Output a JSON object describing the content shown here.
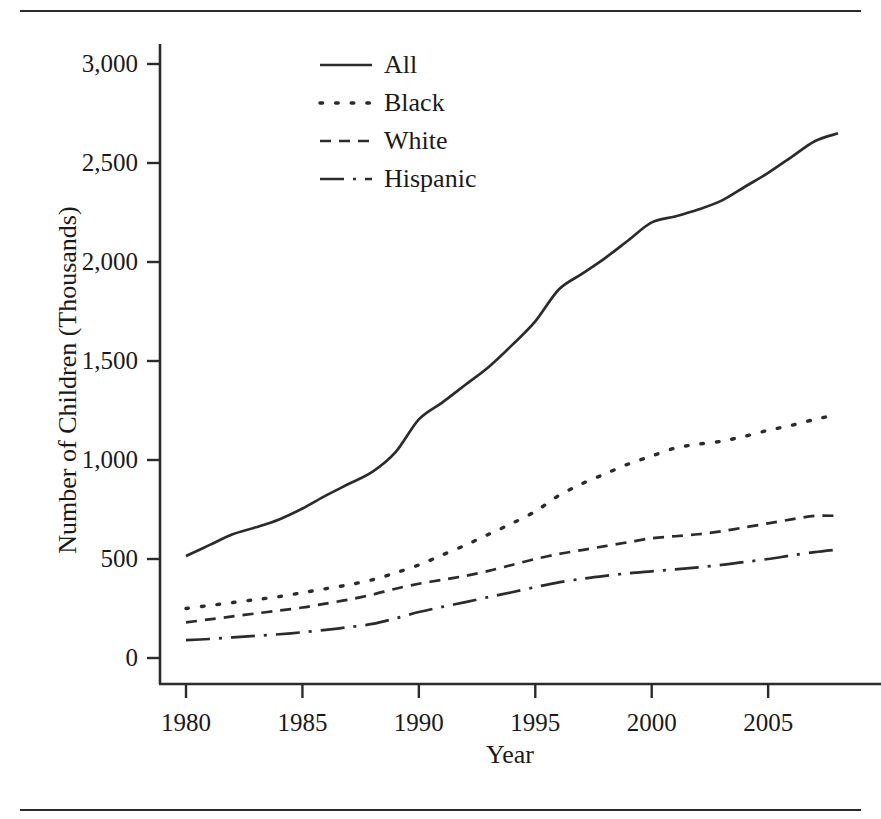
{
  "figure": {
    "has_top_rule": true,
    "has_bottom_rule": true,
    "rule_color": "#2b2b2b"
  },
  "chart_data": {
    "type": "line",
    "title": "",
    "xlabel": "Year",
    "ylabel": "Number of Children (Thousands)",
    "xlim": [
      1980,
      2008
    ],
    "ylim": [
      0,
      3100
    ],
    "xticks": [
      1980,
      1985,
      1990,
      1995,
      2000,
      2005
    ],
    "xtick_labels": [
      "1980",
      "1985",
      "1990",
      "1995",
      "2000",
      "2005"
    ],
    "yticks": [
      0,
      500,
      1000,
      1500,
      2000,
      2500,
      3000
    ],
    "ytick_labels": [
      "0",
      "500",
      "1,000",
      "1,500",
      "2,000",
      "2,500",
      "3,000"
    ],
    "grid": false,
    "legend_position": "upper-center-left",
    "x": [
      1980,
      1981,
      1982,
      1983,
      1984,
      1985,
      1986,
      1987,
      1988,
      1989,
      1990,
      1991,
      1992,
      1993,
      1994,
      1995,
      1996,
      1997,
      1998,
      1999,
      2000,
      2001,
      2002,
      2003,
      2004,
      2005,
      2006,
      2007,
      2008
    ],
    "series": [
      {
        "name": "All",
        "line_style": "solid",
        "color": "#2b2b2b",
        "values": [
          515,
          570,
          625,
          660,
          700,
          755,
          820,
          880,
          940,
          1040,
          1205,
          1290,
          1380,
          1470,
          1580,
          1700,
          1860,
          1940,
          2020,
          2110,
          2200,
          2230,
          2265,
          2310,
          2380,
          2450,
          2530,
          2610,
          2650
        ]
      },
      {
        "name": "Black",
        "line_style": "dotted",
        "color": "#2b2b2b",
        "values": [
          250,
          265,
          280,
          295,
          310,
          330,
          350,
          370,
          395,
          430,
          470,
          520,
          570,
          625,
          680,
          740,
          820,
          880,
          930,
          980,
          1020,
          1060,
          1080,
          1095,
          1120,
          1150,
          1175,
          1205,
          1230
        ]
      },
      {
        "name": "White",
        "line_style": "dashed",
        "color": "#2b2b2b",
        "values": [
          180,
          195,
          210,
          225,
          240,
          255,
          275,
          295,
          320,
          350,
          375,
          395,
          415,
          440,
          470,
          500,
          525,
          545,
          565,
          585,
          605,
          615,
          625,
          640,
          660,
          680,
          700,
          718,
          718
        ]
      },
      {
        "name": "Hispanic",
        "line_style": "dashdot",
        "color": "#2b2b2b",
        "values": [
          90,
          96,
          104,
          112,
          120,
          130,
          142,
          156,
          172,
          200,
          232,
          258,
          282,
          308,
          332,
          358,
          382,
          400,
          415,
          428,
          438,
          448,
          458,
          470,
          485,
          500,
          518,
          535,
          548
        ]
      }
    ]
  },
  "legend": {
    "items": [
      {
        "label": "All",
        "style": "solid"
      },
      {
        "label": "Black",
        "style": "dotted"
      },
      {
        "label": "White",
        "style": "dashed"
      },
      {
        "label": "Hispanic",
        "style": "dashdot"
      }
    ]
  }
}
